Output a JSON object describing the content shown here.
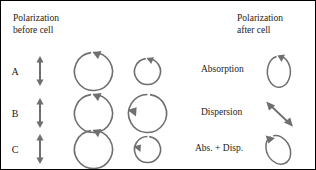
{
  "figure": {
    "type": "physics-polarization-diagram",
    "stroke_color": "#6f6f6f",
    "text_color": "#222222",
    "background": "#ffffff",
    "border_color": "#000000"
  },
  "headers": {
    "before": "Polarization\nbefore cell",
    "after": "Polarization\nafter cell"
  },
  "rows": [
    {
      "label": "A",
      "input_polarization": "linear-vertical",
      "input_icon": "double-headed-vertical-arrow",
      "left_circle": {
        "size": "large",
        "direction": "clockwise",
        "radius": 19
      },
      "right_circle": {
        "size": "small",
        "direction": "clockwise",
        "radius": 13
      }
    },
    {
      "label": "B",
      "input_polarization": "linear-vertical",
      "input_icon": "double-headed-vertical-arrow",
      "left_circle": {
        "size": "large",
        "direction": "clockwise",
        "radius": 19
      },
      "right_circle": {
        "size": "large",
        "direction": "counter-clockwise",
        "radius": 19
      }
    },
    {
      "label": "C",
      "input_polarization": "linear-vertical",
      "input_icon": "double-headed-vertical-arrow",
      "left_circle": {
        "size": "large",
        "direction": "clockwise",
        "radius": 19
      },
      "right_circle": {
        "size": "small",
        "direction": "counter-clockwise",
        "radius": 13
      }
    }
  ],
  "results": [
    {
      "label": "Absorption",
      "symbol": "vertical-ellipse-clockwise",
      "description": "narrow upright ellipse with clockwise arrowhead at top"
    },
    {
      "label": "Dispersion",
      "symbol": "diagonal-double-arrow",
      "description": "double-headed arrow tilted about 45 degrees"
    },
    {
      "label": "Abs. + Disp.",
      "symbol": "tilted-ellipse-counter-clockwise",
      "description": "tilted ellipse with counter-clockwise arrowhead at upper left"
    }
  ]
}
